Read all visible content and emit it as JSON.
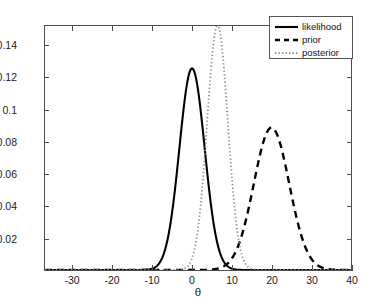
{
  "chart_data": {
    "type": "line",
    "title": "",
    "xlabel": "θ",
    "ylabel": "",
    "xlim": [
      -37,
      40
    ],
    "ylim": [
      0,
      0.1525
    ],
    "grid": false,
    "legend_position": "top-right",
    "xticks": [
      -30,
      -20,
      -10,
      0,
      10,
      20,
      30,
      40
    ],
    "xtick_labels": [
      "-30",
      "-20",
      "-10",
      "0",
      "10",
      "20",
      "30",
      "40"
    ],
    "yticks": [
      0.02,
      0.04,
      0.06,
      0.08,
      0.1,
      0.12,
      0.14
    ],
    "ytick_labels": [
      "0.02",
      "0.04",
      "0.06",
      "0.08",
      "0.1",
      "0.12",
      "0.14"
    ],
    "series": [
      {
        "name": "likelihood",
        "style": "solid",
        "color": "#000000",
        "mean": 0.0,
        "sigma": 3.17,
        "peak": 0.126,
        "x": [
          -37,
          -34,
          -31,
          -28,
          -25,
          -22,
          -19,
          -16,
          -13,
          -11,
          -10,
          -9,
          -8,
          -7,
          -6,
          -5,
          -4,
          -3,
          -2,
          -1,
          0,
          1,
          2,
          3,
          4,
          5,
          6,
          7,
          8,
          9,
          10,
          11,
          13,
          16,
          19,
          22,
          25,
          28,
          31,
          34,
          37,
          40
        ],
        "y": [
          0,
          0,
          0,
          0,
          0,
          0,
          0,
          1e-07,
          2.59e-05,
          0.000266,
          0.000702,
          0.001671,
          0.003584,
          0.006953,
          0.012209,
          0.019403,
          0.027875,
          0.036248,
          0.042601,
          0.046263,
          0.046784,
          0.044288,
          0.039239,
          0.032548,
          0.025259,
          0.018342,
          0.012474,
          0.007945,
          0.004738,
          0.002646,
          0.001384,
          0.000678,
          0.000132,
          3.2e-06,
          0,
          0,
          0,
          0,
          0,
          0,
          0,
          0
        ]
      },
      {
        "name": "prior",
        "style": "dashed",
        "color": "#000000",
        "mean": 20.0,
        "sigma": 4.45,
        "peak": 0.089,
        "x": [
          -37,
          -30,
          -20,
          -10,
          -5,
          0,
          2,
          4,
          6,
          8,
          10,
          11,
          12,
          13,
          14,
          15,
          16,
          17,
          18,
          19,
          20,
          21,
          22,
          23,
          24,
          25,
          26,
          27,
          28,
          29,
          30,
          31,
          32,
          33,
          34,
          36,
          38,
          40
        ],
        "y": [
          0,
          0,
          0,
          0,
          0,
          0,
          0,
          7e-07,
          1e-05,
          0.00011,
          0.00096,
          0.00226,
          0.00479,
          0.00913,
          0.01564,
          0.02409,
          0.03339,
          0.04158,
          0.04647,
          0.04706,
          0.0434,
          0.03646,
          0.02804,
          0.0196,
          0.01243,
          0.00714,
          0.00372,
          0.00175,
          0.00074,
          0.00028,
          9.5e-05,
          3e-05,
          8e-06,
          2e-06,
          0,
          0,
          0,
          0
        ]
      },
      {
        "name": "posterior",
        "style": "dotted",
        "color": "#8c8c8c",
        "mean": 6.4,
        "sigma": 2.6,
        "peak": 0.153,
        "x": [
          -37,
          -20,
          -10,
          -5,
          -3,
          -2,
          -1,
          0,
          1,
          2,
          3,
          4,
          5,
          6,
          6.4,
          7,
          8,
          9,
          10,
          11,
          12,
          13,
          14,
          15,
          16,
          17,
          18,
          20,
          24,
          30,
          40
        ],
        "y": [
          0,
          0,
          0,
          0,
          2e-05,
          8e-05,
          0.00029,
          0.00093,
          0.00267,
          0.00684,
          0.01569,
          0.03221,
          0.05922,
          0.09745,
          0.103,
          0.09745,
          0.05922,
          0.03221,
          0.01569,
          0.00684,
          0.00267,
          0.00093,
          0.00029,
          8e-05,
          2e-05,
          4e-06,
          0,
          0,
          0,
          0,
          0
        ]
      }
    ]
  },
  "legend": {
    "items": [
      {
        "label": "likelihood",
        "style": "solid"
      },
      {
        "label": "prior",
        "style": "dashed"
      },
      {
        "label": "posterior",
        "style": "dotted"
      }
    ]
  },
  "axes": {
    "x_label": "θ"
  },
  "colors": {
    "axis": "#4d4d4d",
    "text": "#1a1a1a",
    "background": "#ffffff",
    "likelihood": "#000000",
    "prior": "#000000",
    "posterior": "#8c8c8c"
  }
}
